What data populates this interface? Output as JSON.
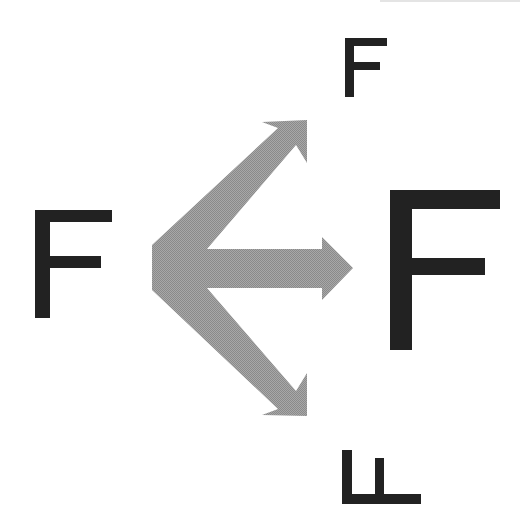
{
  "figure": {
    "colors": {
      "letter": "#222222",
      "arrow": "#9c9c9c",
      "background": "#ffffff"
    },
    "source_letter": {
      "glyph": "F",
      "label": "original F (left)"
    },
    "targets": [
      {
        "id": "top",
        "glyph": "F",
        "transform": "scaled-down, upright",
        "label": "small upright F (top)"
      },
      {
        "id": "middle",
        "glyph": "F",
        "transform": "scaled-up, upright",
        "label": "large upright F (right)"
      },
      {
        "id": "bottom",
        "glyph": "F",
        "transform": "rotated 90° / flipped",
        "label": "rotated F (bottom)"
      }
    ],
    "arrows": [
      {
        "id": "arrow-up",
        "direction": "up-right",
        "to": "top"
      },
      {
        "id": "arrow-right",
        "direction": "right",
        "to": "middle"
      },
      {
        "id": "arrow-down",
        "direction": "down-right",
        "to": "bottom"
      }
    ]
  }
}
